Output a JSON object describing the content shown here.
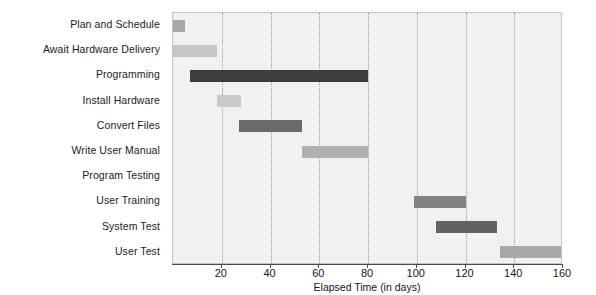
{
  "chart_data": {
    "type": "bar",
    "orientation": "horizontal",
    "subtype": "gantt",
    "title": "",
    "xlabel": "Elapsed Time (in days)",
    "ylabel": "",
    "xlim": [
      0,
      160
    ],
    "xticks": [
      20,
      40,
      60,
      80,
      100,
      120,
      140,
      160
    ],
    "xtick_labels": [
      "20",
      "40",
      "60",
      "80",
      "100",
      "120",
      "140",
      "160"
    ],
    "grid": "vertical-dotted",
    "legend": "none",
    "categories": [
      "Plan and Schedule",
      "Await Hardware Delivery",
      "Programming",
      "Install Hardware",
      "Convert Files",
      "Write User Manual",
      "Program Testing",
      "User Training",
      "System Test",
      "User Test"
    ],
    "tasks": [
      {
        "label": "Plan and Schedule",
        "start": 0,
        "end": 5,
        "duration": 5,
        "color": "#a8a8a8"
      },
      {
        "label": "Await Hardware Delivery",
        "start": 0,
        "end": 18,
        "duration": 18,
        "color": "#c6c6c6"
      },
      {
        "label": "Programming",
        "start": 7,
        "end": 80,
        "duration": 73,
        "color": "#3c3c3c"
      },
      {
        "label": "Install Hardware",
        "start": 18,
        "end": 28,
        "duration": 10,
        "color": "#cacaca"
      },
      {
        "label": "Convert Files",
        "start": 27,
        "end": 53,
        "duration": 26,
        "color": "#6a6a6a"
      },
      {
        "label": "Write User Manual",
        "start": 53,
        "end": 80,
        "duration": 27,
        "color": "#b0b0b0"
      },
      {
        "label": "Program Testing",
        "start": null,
        "end": null,
        "duration": 0,
        "color": "none"
      },
      {
        "label": "User Training",
        "start": 99,
        "end": 120,
        "duration": 21,
        "color": "#838383"
      },
      {
        "label": "System Test",
        "start": 108,
        "end": 133,
        "duration": 25,
        "color": "#626262"
      },
      {
        "label": "User Test",
        "start": 134,
        "end": 160,
        "duration": 26,
        "color": "#a9a9a9"
      }
    ],
    "colors": {
      "plot_background": "#f1f1f1",
      "plot_border": "#c4c4c4",
      "gridline": "#9b9b9b",
      "axis": "#4a4a4a",
      "text": "#161616"
    }
  }
}
